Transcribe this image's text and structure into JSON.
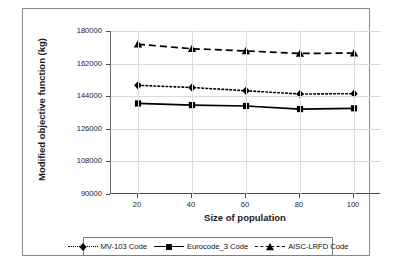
{
  "chart_data": {
    "type": "line",
    "title": "",
    "xlabel": "Size of population",
    "ylabel": "Modified objective function (kg)",
    "x": [
      20,
      40,
      60,
      80,
      100
    ],
    "xticks": [
      "20",
      "40",
      "60",
      "80",
      "100"
    ],
    "xlim": [
      10,
      110
    ],
    "yticks": [
      "90000",
      "108000",
      "126000",
      "144000",
      "162000",
      "180000"
    ],
    "ytick_values": [
      90000,
      108000,
      126000,
      144000,
      162000,
      180000
    ],
    "ylim": [
      90000,
      180000
    ],
    "grid": "horizontal-and-vertical",
    "legend_position": "bottom",
    "series": [
      {
        "name": "MV-103 Code",
        "marker": "diamond",
        "linestyle": "dotted",
        "color": "#000000",
        "values": [
          150000,
          148800,
          147000,
          145200,
          145400
        ]
      },
      {
        "name": "Eurocode_3 Code",
        "marker": "square",
        "linestyle": "solid",
        "color": "#000000",
        "values": [
          140000,
          139100,
          138600,
          136900,
          137300
        ]
      },
      {
        "name": "AISC-LRFD Code",
        "marker": "triangle",
        "linestyle": "dashed",
        "color": "#000000",
        "values": [
          172700,
          170200,
          169000,
          167600,
          167800
        ]
      }
    ]
  },
  "axis": {
    "y_title": "Modified objective function (kg)",
    "x_title": "Size of population"
  },
  "legend": {
    "items": [
      {
        "label": "MV-103 Code",
        "icon": "diamond-marker-icon",
        "linestyle": "dotted"
      },
      {
        "label": "Eurocode_3 Code",
        "icon": "square-marker-icon",
        "linestyle": "solid"
      },
      {
        "label": "AISC-LRFD Code",
        "icon": "triangle-marker-icon",
        "linestyle": "dashed"
      }
    ]
  }
}
